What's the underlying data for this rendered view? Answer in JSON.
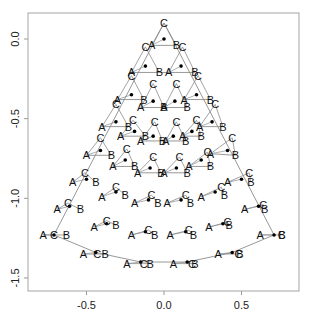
{
  "chart_data": {
    "type": "scatter",
    "title": "",
    "xlabel": "",
    "ylabel": "",
    "xlim": [
      -0.87,
      0.87
    ],
    "ylim": [
      -1.58,
      0.16
    ],
    "x_ticks": [
      -0.5,
      0.0,
      0.5
    ],
    "x_tick_labels": [
      "-0.5",
      "0.0",
      "0.5"
    ],
    "y_ticks": [
      0.0,
      -0.5,
      -1.0,
      -1.5
    ],
    "y_tick_labels": [
      "0.0",
      "-0.5",
      "-1.0",
      "-1.5"
    ],
    "grid": false,
    "legend": null,
    "vertex_labels": [
      "A",
      "B",
      "C"
    ],
    "triangles": [
      {
        "center": [
          0.0,
          0.0
        ],
        "A": [
          -0.08,
          -0.04
        ],
        "B": [
          0.08,
          -0.04
        ],
        "C": [
          0.0,
          0.1
        ]
      },
      {
        "center": [
          -0.12,
          -0.17
        ],
        "A": [
          -0.21,
          -0.21
        ],
        "B": [
          -0.03,
          -0.21
        ],
        "C": [
          -0.12,
          -0.05
        ]
      },
      {
        "center": [
          0.11,
          -0.17
        ],
        "A": [
          0.03,
          -0.21
        ],
        "B": [
          0.2,
          -0.21
        ],
        "C": [
          0.12,
          -0.05
        ]
      },
      {
        "center": [
          -0.21,
          -0.35
        ],
        "A": [
          -0.3,
          -0.38
        ],
        "B": [
          -0.13,
          -0.38
        ],
        "C": [
          -0.21,
          -0.23
        ]
      },
      {
        "center": [
          -0.07,
          -0.39
        ],
        "A": [
          -0.15,
          -0.43
        ],
        "B": [
          0.0,
          -0.43
        ],
        "C": [
          -0.07,
          -0.28
        ]
      },
      {
        "center": [
          0.07,
          -0.39
        ],
        "A": [
          0.0,
          -0.43
        ],
        "B": [
          0.15,
          -0.43
        ],
        "C": [
          0.08,
          -0.28
        ]
      },
      {
        "center": [
          0.21,
          -0.35
        ],
        "A": [
          0.13,
          -0.38
        ],
        "B": [
          0.3,
          -0.38
        ],
        "C": [
          0.22,
          -0.23
        ]
      },
      {
        "center": [
          -0.31,
          -0.52
        ],
        "A": [
          -0.4,
          -0.55
        ],
        "B": [
          -0.23,
          -0.55
        ],
        "C": [
          -0.31,
          -0.41
        ]
      },
      {
        "center": [
          -0.19,
          -0.58
        ],
        "A": [
          -0.28,
          -0.61
        ],
        "B": [
          -0.12,
          -0.61
        ],
        "C": [
          -0.2,
          -0.51
        ]
      },
      {
        "center": [
          -0.07,
          -0.61
        ],
        "A": [
          -0.15,
          -0.64
        ],
        "B": [
          -0.01,
          -0.64
        ],
        "C": [
          -0.06,
          -0.52
        ]
      },
      {
        "center": [
          0.06,
          -0.61
        ],
        "A": [
          0.01,
          -0.64
        ],
        "B": [
          0.14,
          -0.64
        ],
        "C": [
          0.08,
          -0.52
        ]
      },
      {
        "center": [
          0.18,
          -0.58
        ],
        "A": [
          0.12,
          -0.61
        ],
        "B": [
          0.24,
          -0.61
        ],
        "C": [
          0.21,
          -0.51
        ]
      },
      {
        "center": [
          0.31,
          -0.52
        ],
        "A": [
          0.23,
          -0.55
        ],
        "B": [
          0.38,
          -0.55
        ],
        "C": [
          0.33,
          -0.41
        ]
      },
      {
        "center": [
          -0.41,
          -0.7
        ],
        "A": [
          -0.5,
          -0.73
        ],
        "B": [
          -0.34,
          -0.73
        ],
        "C": [
          -0.41,
          -0.62
        ]
      },
      {
        "center": [
          -0.25,
          -0.76
        ],
        "A": [
          -0.33,
          -0.8
        ],
        "B": [
          -0.19,
          -0.8
        ],
        "C": [
          -0.24,
          -0.69
        ]
      },
      {
        "center": [
          -0.09,
          -0.81
        ],
        "A": [
          -0.17,
          -0.84
        ],
        "B": [
          -0.02,
          -0.84
        ],
        "C": [
          -0.07,
          -0.74
        ]
      },
      {
        "center": [
          0.08,
          -0.81
        ],
        "A": [
          0.0,
          -0.84
        ],
        "B": [
          0.15,
          -0.84
        ],
        "C": [
          0.1,
          -0.74
        ]
      },
      {
        "center": [
          0.24,
          -0.76
        ],
        "A": [
          0.16,
          -0.8
        ],
        "B": [
          0.3,
          -0.8
        ],
        "C": [
          0.28,
          -0.71
        ]
      },
      {
        "center": [
          0.41,
          -0.7
        ],
        "A": [
          0.3,
          -0.72
        ],
        "B": [
          0.46,
          -0.73
        ],
        "C": [
          0.44,
          -0.62
        ]
      },
      {
        "center": [
          -0.5,
          -0.88
        ],
        "A": [
          -0.59,
          -0.9
        ],
        "B": [
          -0.44,
          -0.9
        ],
        "C": [
          -0.51,
          -0.84
        ]
      },
      {
        "center": [
          -0.31,
          -0.96
        ],
        "A": [
          -0.4,
          -0.99
        ],
        "B": [
          -0.25,
          -0.98
        ],
        "C": [
          -0.31,
          -0.93
        ]
      },
      {
        "center": [
          -0.1,
          -1.01
        ],
        "A": [
          -0.19,
          -1.03
        ],
        "B": [
          -0.04,
          -1.03
        ],
        "C": [
          -0.08,
          -0.98
        ]
      },
      {
        "center": [
          0.11,
          -1.01
        ],
        "A": [
          0.02,
          -1.03
        ],
        "B": [
          0.17,
          -1.03
        ],
        "C": [
          0.14,
          -0.98
        ]
      },
      {
        "center": [
          0.33,
          -0.96
        ],
        "A": [
          0.24,
          -0.99
        ],
        "B": [
          0.39,
          -0.98
        ],
        "C": [
          0.37,
          -0.93
        ]
      },
      {
        "center": [
          0.5,
          -0.88
        ],
        "A": [
          0.41,
          -0.9
        ],
        "B": [
          0.56,
          -0.9
        ],
        "C": [
          0.55,
          -0.84
        ]
      },
      {
        "center": [
          -0.61,
          -1.05
        ],
        "A": [
          -0.69,
          -1.07
        ],
        "B": [
          -0.54,
          -1.07
        ],
        "C": [
          -0.62,
          -1.03
        ]
      },
      {
        "center": [
          -0.37,
          -1.16
        ],
        "A": [
          -0.45,
          -1.18
        ],
        "B": [
          -0.31,
          -1.17
        ],
        "C": [
          -0.37,
          -1.14
        ]
      },
      {
        "center": [
          -0.12,
          -1.21
        ],
        "A": [
          -0.21,
          -1.23
        ],
        "B": [
          -0.06,
          -1.23
        ],
        "C": [
          -0.1,
          -1.2
        ]
      },
      {
        "center": [
          0.14,
          -1.21
        ],
        "A": [
          0.04,
          -1.23
        ],
        "B": [
          0.19,
          -1.23
        ],
        "C": [
          0.16,
          -1.2
        ]
      },
      {
        "center": [
          0.38,
          -1.16
        ],
        "A": [
          0.29,
          -1.18
        ],
        "B": [
          0.42,
          -1.17
        ],
        "C": [
          0.41,
          -1.15
        ]
      },
      {
        "center": [
          0.61,
          -1.05
        ],
        "A": [
          0.52,
          -1.07
        ],
        "B": [
          0.65,
          -1.07
        ],
        "C": [
          0.64,
          -1.04
        ]
      },
      {
        "center": [
          -0.71,
          -1.23
        ],
        "A": [
          -0.78,
          -1.23
        ],
        "B": [
          -0.63,
          -1.23
        ],
        "C": [
          -0.71,
          -1.23
        ]
      },
      {
        "center": [
          -0.44,
          -1.34
        ],
        "A": [
          -0.52,
          -1.35
        ],
        "B": [
          -0.38,
          -1.35
        ],
        "C": [
          -0.43,
          -1.35
        ]
      },
      {
        "center": [
          -0.15,
          -1.4
        ],
        "A": [
          -0.24,
          -1.41
        ],
        "B": [
          -0.09,
          -1.41
        ],
        "C": [
          -0.13,
          -1.41
        ]
      },
      {
        "center": [
          0.15,
          -1.4
        ],
        "A": [
          0.06,
          -1.41
        ],
        "B": [
          0.2,
          -1.41
        ],
        "C": [
          0.18,
          -1.41
        ]
      },
      {
        "center": [
          0.44,
          -1.34
        ],
        "A": [
          0.35,
          -1.35
        ],
        "B": [
          0.49,
          -1.35
        ],
        "C": [
          0.48,
          -1.35
        ]
      },
      {
        "center": [
          0.71,
          -1.23
        ],
        "A": [
          0.62,
          -1.23
        ],
        "B": [
          0.76,
          -1.23
        ],
        "C": [
          0.76,
          -1.23
        ]
      }
    ],
    "outer_boundary": [
      [
        0.0,
        0.1
      ],
      [
        -0.71,
        -1.23
      ],
      [
        -0.44,
        -1.34
      ],
      [
        -0.15,
        -1.4
      ],
      [
        0.15,
        -1.4
      ],
      [
        0.44,
        -1.34
      ],
      [
        0.71,
        -1.23
      ],
      [
        0.0,
        0.1
      ]
    ],
    "horizontal_segments": [
      [
        [
          -0.08,
          -0.04
        ],
        [
          0.08,
          -0.04
        ]
      ],
      [
        [
          -0.21,
          -0.21
        ],
        [
          0.2,
          -0.21
        ]
      ],
      [
        [
          -0.3,
          -0.38
        ],
        [
          -0.13,
          -0.38
        ]
      ],
      [
        [
          0.13,
          -0.38
        ],
        [
          0.3,
          -0.38
        ]
      ],
      [
        [
          -0.15,
          -0.43
        ],
        [
          0.15,
          -0.43
        ]
      ],
      [
        [
          -0.4,
          -0.55
        ],
        [
          -0.23,
          -0.55
        ]
      ],
      [
        [
          0.23,
          -0.55
        ],
        [
          0.38,
          -0.55
        ]
      ],
      [
        [
          -0.28,
          -0.61
        ],
        [
          -0.12,
          -0.61
        ]
      ],
      [
        [
          0.12,
          -0.61
        ],
        [
          0.24,
          -0.61
        ]
      ],
      [
        [
          -0.15,
          -0.64
        ],
        [
          0.14,
          -0.64
        ]
      ],
      [
        [
          -0.5,
          -0.73
        ],
        [
          -0.34,
          -0.73
        ]
      ],
      [
        [
          0.3,
          -0.72
        ],
        [
          0.46,
          -0.73
        ]
      ],
      [
        [
          -0.33,
          -0.8
        ],
        [
          -0.19,
          -0.8
        ]
      ],
      [
        [
          0.16,
          -0.8
        ],
        [
          0.3,
          -0.8
        ]
      ],
      [
        [
          -0.17,
          -0.84
        ],
        [
          0.15,
          -0.84
        ]
      ]
    ],
    "colors": {
      "line": "#8c8c8c",
      "text": "#111111",
      "point": "#000000",
      "axes": "#9a9a9a"
    }
  }
}
